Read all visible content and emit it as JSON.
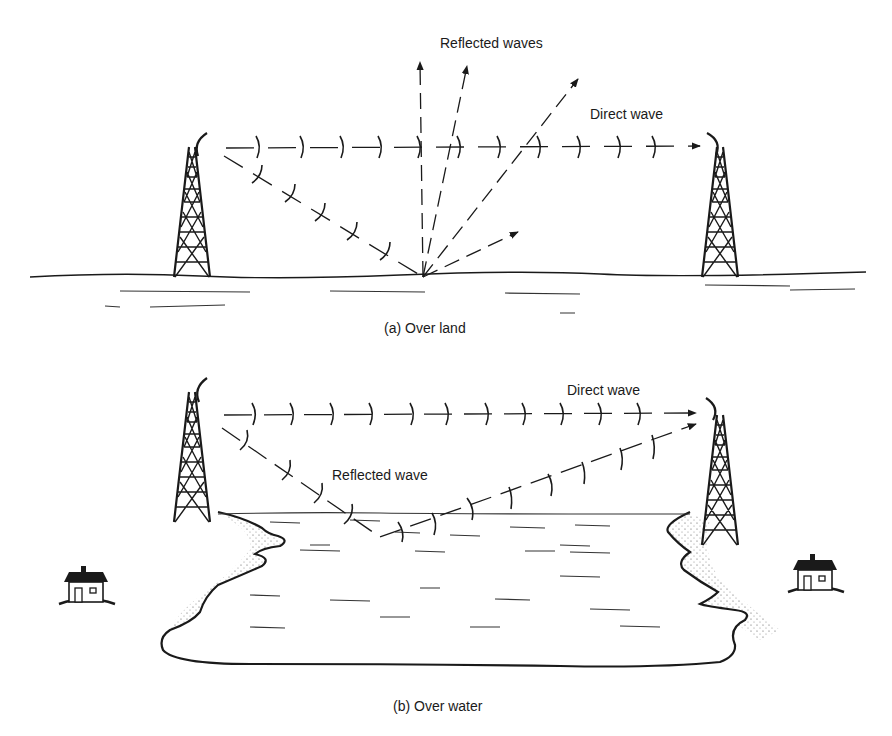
{
  "figure": {
    "panel_a": {
      "caption": "(a)  Over land",
      "labels": {
        "reflected": "Reflected waves",
        "direct": "Direct wave"
      }
    },
    "panel_b": {
      "caption": "(b)  Over water",
      "labels": {
        "reflected": "Reflected wave",
        "direct": "Direct wave"
      }
    }
  },
  "colors": {
    "ink": "#1a1a1a",
    "background": "#ffffff"
  }
}
